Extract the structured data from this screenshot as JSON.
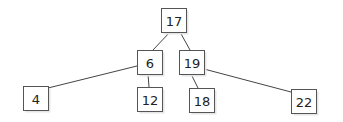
{
  "diagram": {
    "type": "binary-search-tree",
    "nodes": [
      {
        "id": "n17",
        "label": "17"
      },
      {
        "id": "n6",
        "label": "6"
      },
      {
        "id": "n19",
        "label": "19"
      },
      {
        "id": "n4",
        "label": "4"
      },
      {
        "id": "n12",
        "label": "12"
      },
      {
        "id": "n18",
        "label": "18"
      },
      {
        "id": "n22",
        "label": "22"
      }
    ],
    "edges": [
      {
        "from": "n17",
        "to": "n6"
      },
      {
        "from": "n17",
        "to": "n19"
      },
      {
        "from": "n6",
        "to": "n4"
      },
      {
        "from": "n6",
        "to": "n12"
      },
      {
        "from": "n19",
        "to": "n18"
      },
      {
        "from": "n19",
        "to": "n22"
      }
    ]
  }
}
